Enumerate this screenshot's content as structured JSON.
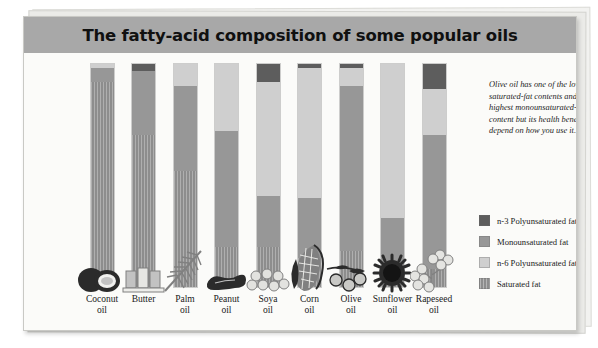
{
  "header": {
    "title": "The fatty-acid composition of some popular oils"
  },
  "annotation": {
    "text": "Olive oil has one of the lowest saturated-fat contents and the highest monounsaturated-fat content but its health benefits depend on how you use it."
  },
  "legend": {
    "items": [
      {
        "label": "n-3 Polyunsaturated fat",
        "color": "#5d5d5d",
        "key": "n3"
      },
      {
        "label": "Monounsaturated fat",
        "color": "#979797",
        "key": "mono"
      },
      {
        "label": "n-6 Polyunsaturated fat",
        "color": "#cfcfcf",
        "key": "n6"
      },
      {
        "label": "Saturated fat",
        "color": "#8d8d8d",
        "key": "sat"
      }
    ]
  },
  "chart_data": {
    "type": "bar",
    "title": "The fatty-acid composition of some popular oils",
    "xlabel": "",
    "ylabel": "",
    "ylim": [
      0,
      100
    ],
    "stacked": true,
    "grid": false,
    "legend_position": "right",
    "categories": [
      "Coconut oil",
      "Butter",
      "Palm oil",
      "Peanut oil",
      "Soya oil",
      "Corn oil",
      "Olive oil",
      "Sunflower oil",
      "Rapeseed oil"
    ],
    "category_lines": [
      [
        "Coconut",
        "oil"
      ],
      [
        "Butter",
        ""
      ],
      [
        "Palm",
        "oil"
      ],
      [
        "Peanut",
        "oil"
      ],
      [
        "Soya",
        "oil"
      ],
      [
        "Corn",
        "oil"
      ],
      [
        "Olive",
        "oil"
      ],
      [
        "Sunflower",
        "oil"
      ],
      [
        "Rapeseed",
        "oil"
      ]
    ],
    "series": [
      {
        "name": "n-3 Polyunsaturated fat",
        "color": "#5d5d5d",
        "values": [
          0,
          3,
          0,
          0,
          8,
          2,
          2,
          0,
          11
        ]
      },
      {
        "name": "n-6 Polyunsaturated fat",
        "color": "#cfcfcf",
        "values": [
          2,
          0,
          10,
          30,
          51,
          58,
          8,
          69,
          21
        ]
      },
      {
        "name": "Monounsaturated fat",
        "color": "#979797",
        "values": [
          6,
          29,
          38,
          52,
          23,
          27,
          74,
          20,
          60
        ]
      },
      {
        "name": "Saturated fat",
        "color": "#8d8d8d",
        "values": [
          92,
          68,
          52,
          18,
          18,
          13,
          16,
          11,
          8
        ]
      }
    ],
    "stack_order_top_to_bottom": [
      "n3",
      "n6",
      "mono",
      "sat"
    ],
    "illustrations": [
      "coconut",
      "butter-sticks",
      "palm-frond",
      "peanut",
      "soya-beans",
      "corn-cob",
      "olives",
      "sunflower",
      "rapeseed-flowers"
    ]
  }
}
